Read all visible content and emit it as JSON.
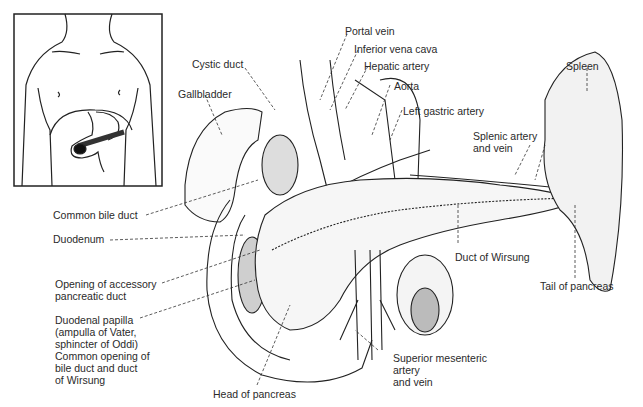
{
  "labels": {
    "portal_vein": "Portal vein",
    "inferior_vena_cava": "Inferior vena cava",
    "hepatic_artery": "Hepatic artery",
    "aorta": "Aorta",
    "left_gastric_artery": "Left gastric artery",
    "cystic_duct": "Cystic duct",
    "gallbladder": "Gallbladder",
    "spleen": "Spleen",
    "splenic_artery_l1": "Splenic artery",
    "splenic_artery_l2": "and vein",
    "common_bile_duct": "Common bile duct",
    "duodenum": "Duodenum",
    "accessory_l1": "Opening of accessory",
    "accessory_l2": "pancreatic duct",
    "papilla_l1": "Duodenal papilla",
    "papilla_l2": "(ampulla of Vater,",
    "papilla_l3": "sphincter of Oddi)",
    "papilla_l4": "Common opening of",
    "papilla_l5": "bile duct and duct",
    "papilla_l6": "of Wirsung",
    "duct_of_wirsung": "Duct of Wirsung",
    "tail_of_pancreas": "Tail of pancreas",
    "sma_l1": "Superior mesenteric",
    "sma_l2": "artery",
    "sma_l3": "and vein",
    "head_of_pancreas": "Head of pancreas"
  },
  "colors": {
    "line": "#222222",
    "shade": "#555555",
    "background": "#ffffff"
  }
}
